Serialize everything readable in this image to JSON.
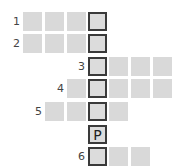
{
  "puzzle": {
    "type": "crossword-keyword",
    "rows": [
      {
        "label": "1",
        "start_col": 0,
        "length": 4,
        "letters": [
          "",
          "",
          "",
          ""
        ]
      },
      {
        "label": "2",
        "start_col": 0,
        "length": 4,
        "letters": [
          "",
          "",
          "",
          ""
        ]
      },
      {
        "label": "3",
        "start_col": 3,
        "length": 4,
        "letters": [
          "",
          "",
          "",
          ""
        ]
      },
      {
        "label": "4",
        "start_col": 2,
        "length": 5,
        "letters": [
          "",
          "",
          "",
          "",
          ""
        ]
      },
      {
        "label": "5",
        "start_col": 1,
        "length": 4,
        "letters": [
          "",
          "",
          "",
          ""
        ]
      },
      {
        "label": "",
        "start_col": 3,
        "length": 1,
        "letters": [
          "P"
        ]
      },
      {
        "label": "6",
        "start_col": 3,
        "length": 3,
        "letters": [
          "",
          "",
          ""
        ]
      }
    ],
    "key_column": 3,
    "colors": {
      "cell": "#d9d9d9",
      "key_border": "#3a3a3a",
      "label": "#444444"
    }
  }
}
